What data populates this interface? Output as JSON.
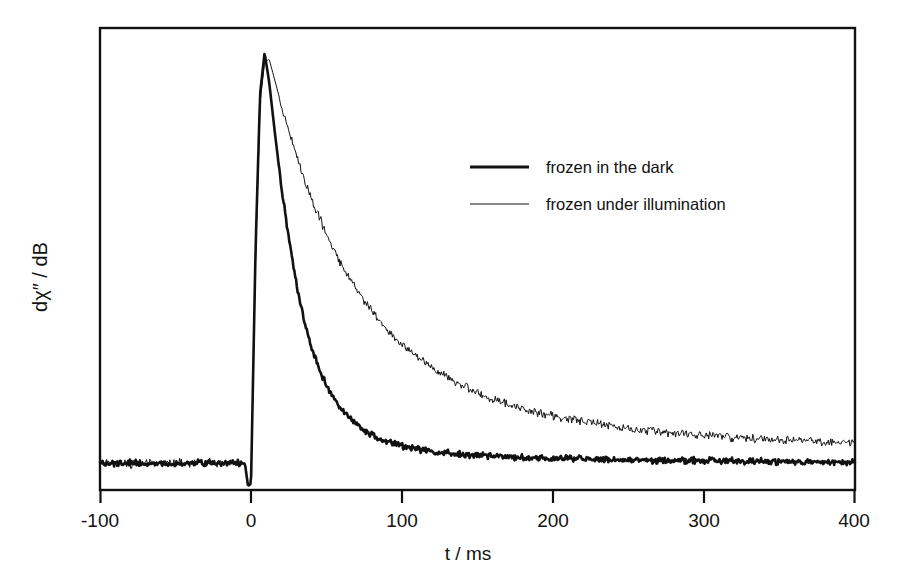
{
  "figure": {
    "background": "#ffffff",
    "ink_color": "#111111"
  },
  "chart_data": {
    "type": "line",
    "title": "",
    "xlabel": "t  /  ms",
    "ylabel": "dχ″ / dB",
    "xlim": [
      -100,
      400
    ],
    "ylim": [
      -0.06,
      1.06
    ],
    "xticks": [
      -100,
      0,
      100,
      200,
      300,
      400
    ],
    "xtick_labels": [
      "-100",
      "0",
      "100",
      "200",
      "300",
      "400"
    ],
    "yticks": [],
    "ytick_labels": [],
    "grid": false,
    "frame": "box",
    "legend_position": "upper-right-inside",
    "annotations": [],
    "series": [
      {
        "name": "frozen in the dark",
        "line_style": "solid",
        "line_width": 2.6,
        "color": "#111111",
        "peak_t": 9,
        "peak_value": 1.0,
        "baseline_value": 0.0,
        "decay_tau_ms": 34,
        "noise_amplitude": 0.009,
        "x": [
          -100,
          -90,
          -80,
          -70,
          -60,
          -50,
          -40,
          -30,
          -20,
          -10,
          -4,
          -2,
          0,
          3,
          6,
          9,
          12,
          16,
          20,
          25,
          30,
          35,
          40,
          50,
          60,
          70,
          80,
          90,
          100,
          120,
          140,
          160,
          180,
          200,
          225,
          250,
          275,
          300,
          325,
          350,
          375,
          400
        ],
        "y": [
          0.005,
          0.004,
          0.007,
          0.003,
          0.006,
          0.004,
          0.008,
          0.003,
          0.006,
          0.005,
          0.004,
          -0.05,
          -0.045,
          0.52,
          0.9,
          1.0,
          0.93,
          0.8,
          0.68,
          0.55,
          0.44,
          0.355,
          0.285,
          0.19,
          0.135,
          0.098,
          0.073,
          0.057,
          0.046,
          0.033,
          0.026,
          0.022,
          0.019,
          0.017,
          0.015,
          0.013,
          0.012,
          0.011,
          0.01,
          0.009,
          0.008,
          0.007
        ]
      },
      {
        "name": "frozen under illumination",
        "line_style": "solid",
        "line_width": 1.0,
        "color": "#111111",
        "peak_t": 11,
        "peak_value": 0.985,
        "baseline_value": 0.0,
        "decay_tau_ms": 108,
        "noise_amplitude": 0.012,
        "x": [
          -100,
          -90,
          -80,
          -70,
          -60,
          -50,
          -40,
          -30,
          -20,
          -10,
          -4,
          -2,
          0,
          3,
          6,
          9,
          12,
          16,
          20,
          25,
          30,
          40,
          50,
          60,
          70,
          80,
          90,
          100,
          120,
          140,
          160,
          180,
          200,
          225,
          250,
          275,
          300,
          325,
          350,
          375,
          400
        ],
        "y": [
          0.004,
          0.006,
          0.003,
          0.007,
          0.004,
          0.006,
          0.003,
          0.007,
          0.005,
          0.004,
          0.005,
          -0.048,
          -0.044,
          0.5,
          0.88,
          0.975,
          0.985,
          0.93,
          0.875,
          0.81,
          0.75,
          0.645,
          0.56,
          0.485,
          0.425,
          0.375,
          0.33,
          0.295,
          0.235,
          0.192,
          0.16,
          0.137,
          0.12,
          0.103,
          0.09,
          0.08,
          0.072,
          0.066,
          0.061,
          0.057,
          0.053
        ]
      }
    ]
  },
  "legend": {
    "entries": [
      {
        "label": "frozen in the dark",
        "swatch": "thick-line-swatch"
      },
      {
        "label": "frozen under illumination",
        "swatch": "thin-line-swatch"
      }
    ]
  },
  "axes": {
    "x_title": "t  /  ms",
    "y_title": "dχ″ / dB",
    "x_tick_labels": [
      "-100",
      "0",
      "100",
      "200",
      "300",
      "400"
    ]
  }
}
